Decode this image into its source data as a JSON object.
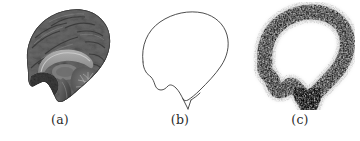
{
  "figure": {
    "panel_count": 3,
    "background_color": "#ffffff",
    "label_color": "#2a2a2a",
    "panels": [
      {
        "label": "(a)",
        "name": "brain-anatomical-image",
        "description": "grayscale mid-sagittal anatomical brain photograph",
        "render": "photo",
        "tone_dark": "#3a3a3a",
        "tone_mid": "#6f6f6f",
        "tone_light": "#a8a8a8"
      },
      {
        "label": "(b)",
        "name": "brain-outline-contour",
        "description": "thin black outline contour traced from the brain",
        "render": "outline",
        "stroke_color": "#353535",
        "stroke_width": 0.9
      },
      {
        "label": "(c)",
        "name": "brain-blurred-noisy-contour",
        "description": "blurred speckled noisy band following the brain contour",
        "render": "noise",
        "ink_color": "#111111",
        "band_width": 17
      }
    ],
    "contour_path": "M 30 62 C 29 44 38 27 53 19 C 68 11 86 10 97 18 C 106 24 110 33 110 43 C 110 54 106 63 100 70 C 94 77 87 83 81 88 C 76 92 72 95 69 97 C 66 99 64 100 62 100 C 60 100 58 98 56 95 C 54 92 53 89 52 86 C 50 82 48 80 45 81 C 42 82 40 84 38 85 C 36 86 34 85 33 83 C 32 81 32 79 32 76 C 32 73 31 70 31 68 C 31 66 30 64 30 62 Z",
    "brainstem_tail": "M 62 100 L 65 110 M 62 100 L 60 97"
  }
}
